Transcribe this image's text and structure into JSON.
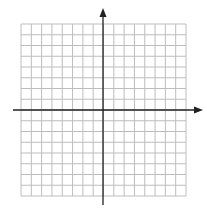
{
  "diagram": {
    "type": "coordinate-grid",
    "grid": {
      "columns": 16,
      "rows": 16,
      "left": 21,
      "right": 186,
      "top": 24,
      "bottom": 196,
      "line_color": "#bdbdbd"
    },
    "axes": {
      "color": "#222222",
      "origin": {
        "x": 103,
        "y": 110
      },
      "x_axis": {
        "from": 13,
        "to": 203,
        "arrow": "right"
      },
      "y_axis": {
        "from": 205,
        "to": 8,
        "arrow": "up"
      }
    }
  }
}
